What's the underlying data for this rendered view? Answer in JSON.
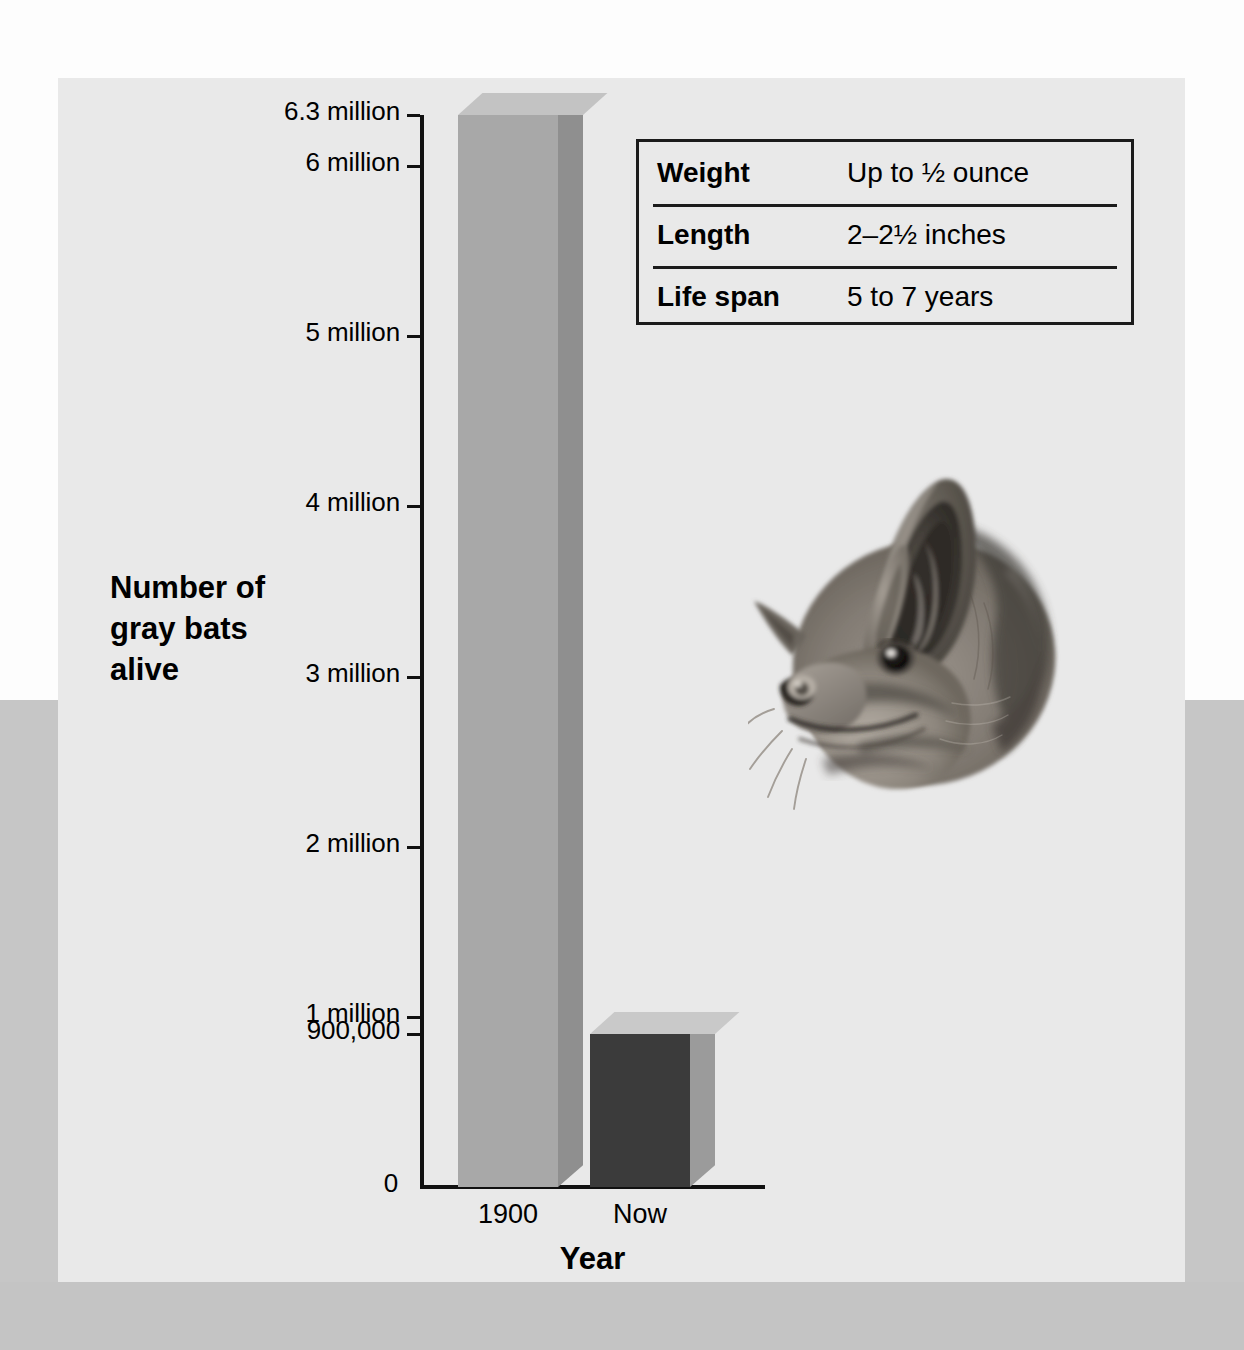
{
  "chart_data": {
    "type": "bar",
    "title": "",
    "categories": [
      "1900",
      "Now"
    ],
    "values": [
      6300000,
      900000
    ],
    "xlabel": "Year",
    "ylabel": "Number of gray bats alive",
    "ylim": [
      0,
      6300000
    ],
    "grid": false,
    "legend": "none",
    "series": [
      {
        "name": "Number of gray bats alive",
        "values": [
          6300000,
          900000
        ],
        "value_labels": [
          "6.3 million",
          "900,000"
        ],
        "colors": [
          "#a8a8a8",
          "#3b3b3b"
        ]
      }
    ],
    "ytick_labels": [
      "6.3 million",
      "6 million",
      "5 million",
      "4 million",
      "3 million",
      "2 million",
      "1 million",
      "900,000",
      "0"
    ],
    "ytick_values": [
      6300000,
      6000000,
      5000000,
      4000000,
      3000000,
      2000000,
      1000000,
      900000,
      0
    ]
  },
  "axes": {
    "y_title": "Number of\ngray bats\nalive",
    "y_title_lines": [
      "Number of",
      "gray bats",
      "alive"
    ],
    "x_title": "Year",
    "x_tick_labels": [
      "1900",
      "Now"
    ]
  },
  "info_table": {
    "rows": [
      {
        "label": "Weight",
        "value": "Up to ½ ounce"
      },
      {
        "label": "Length",
        "value": "2–2½ inches"
      },
      {
        "label": "Life span",
        "value": "5 to 7 years"
      }
    ]
  },
  "illustration": {
    "name": "gray-bat-head-illustration",
    "description": "Grayscale illustration of a gray bat's head"
  },
  "colors": {
    "panel_background": "#e9e9e9",
    "page_background": "#fdfdfd",
    "backdrop_band": "#c6c6c6",
    "bar_1900": "#a8a8a8",
    "bar_1900_top": "#c3c3c3",
    "bar_1900_side": "#8f8f8f",
    "bar_now": "#3b3b3b",
    "bar_now_top": "#c9c9c9",
    "bar_now_side": "#9b9b9b",
    "axis": "#111111",
    "text": "#000000"
  }
}
